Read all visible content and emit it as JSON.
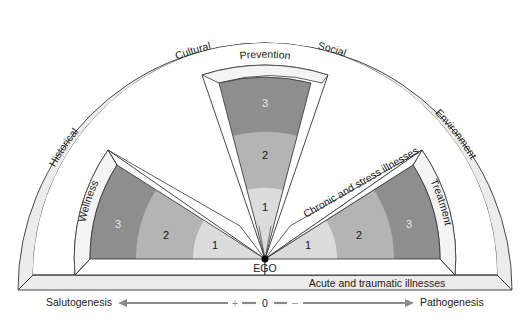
{
  "diagram": {
    "outer_ring": {
      "labels": [
        "Historical",
        "Cultural",
        "Social",
        "Environment"
      ]
    },
    "base_band_label": "Acute and traumatic illnesses",
    "center_label": "EGO",
    "wedges": {
      "wellness": {
        "label": "Wellness",
        "levels": [
          "1",
          "2",
          "3"
        ]
      },
      "prevention": {
        "label": "Prevention",
        "levels": [
          "1",
          "2",
          "3"
        ]
      },
      "treatment": {
        "label": "Treatment",
        "levels": [
          "1",
          "2",
          "3"
        ]
      }
    },
    "chronic_band_label": "Chronic and stress illnesses",
    "axis": {
      "left_label": "Salutogenesis",
      "right_label": "Pathogenesis",
      "plus": "+",
      "zero": "0",
      "minus": "–"
    },
    "colors": {
      "level_1": "#dcdcdc",
      "level_2": "#b4b4b4",
      "level_3": "#8e8e8e",
      "frame_fill": "#ececec",
      "arrow": "#8a8a8a",
      "outline": "#333333"
    }
  }
}
